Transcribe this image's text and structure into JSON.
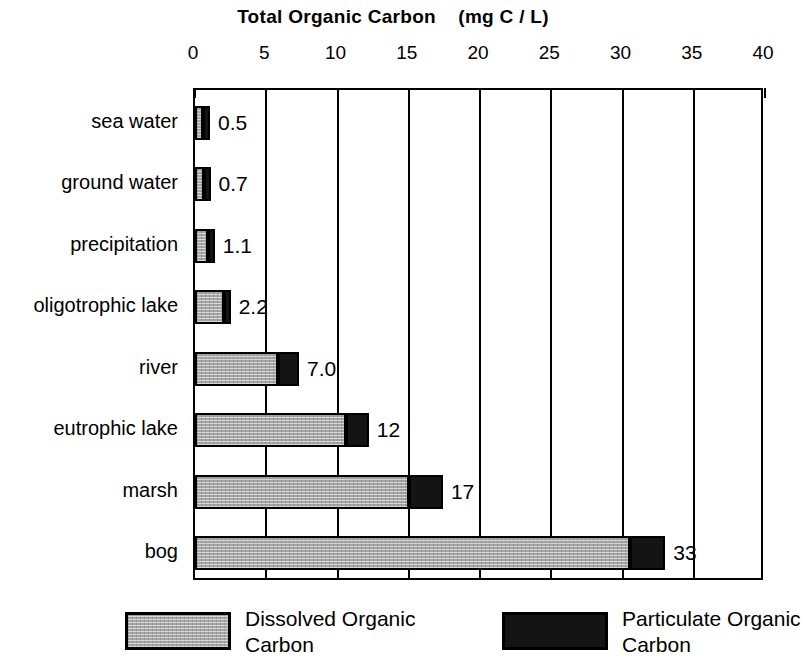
{
  "chart_data": {
    "type": "bar",
    "orientation": "horizontal",
    "stacked": true,
    "title": "Total Organic Carbon    (mg C / L)",
    "xlabel": "",
    "ylabel": "",
    "xlim": [
      0,
      40
    ],
    "xticks": [
      0,
      5,
      10,
      15,
      20,
      25,
      30,
      35,
      40
    ],
    "xtick_labels": [
      "0",
      "5",
      "10",
      "15",
      "20",
      "25",
      "30",
      "35",
      "40"
    ],
    "grid": true,
    "grid_axis": "x",
    "legend_position": "bottom",
    "categories": [
      "sea water",
      "ground water",
      "precipitation",
      "oligotrophic lake",
      "river",
      "eutrophic lake",
      "marsh",
      "bog"
    ],
    "series": [
      {
        "name": "Dissolved Organic Carbon",
        "color": "#a6a6a6",
        "values": [
          0.4,
          0.6,
          0.9,
          2.0,
          5.8,
          10.6,
          15.0,
          30.5
        ]
      },
      {
        "name": "Particulate Organic Carbon",
        "color": "#141414",
        "values": [
          0.1,
          0.1,
          0.2,
          0.5,
          1.5,
          1.6,
          2.4,
          2.5
        ]
      }
    ],
    "totals": [
      0.5,
      0.7,
      1.1,
      2.2,
      7.3,
      12.2,
      17.4,
      33.0
    ],
    "data_labels": [
      "0.5",
      "0.7",
      "1.1",
      "2.2",
      "7.0",
      "12",
      "17",
      "33"
    ]
  },
  "legend": {
    "entries": [
      {
        "label": "Dissolved Organic\nCarbon",
        "swatch": "dissolved"
      },
      {
        "label": "Particulate Organic\nCarbon",
        "swatch": "particulate"
      }
    ]
  }
}
